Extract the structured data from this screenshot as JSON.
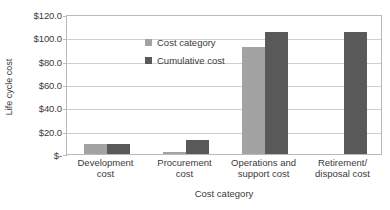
{
  "chart_data": {
    "type": "bar",
    "title": "",
    "xlabel": "Cost category",
    "ylabel": "Life cycle cost",
    "categories": [
      "Development cost",
      "Procurement cost",
      "Operations and support cost",
      "Retirement/ disposal cost"
    ],
    "category_lines": [
      [
        "Development",
        "cost"
      ],
      [
        "Procurement",
        "cost"
      ],
      [
        "Operations and",
        "support cost"
      ],
      [
        "Retirement/",
        "disposal cost"
      ]
    ],
    "series": [
      {
        "name": "Cost category",
        "color": "#a3a3a3",
        "values": [
          9,
          2,
          92,
          null
        ]
      },
      {
        "name": "Cumulative cost",
        "color": "#595959",
        "values": [
          9,
          12,
          105,
          105
        ]
      }
    ],
    "ylim": [
      0,
      120
    ],
    "ytick_values": [
      0,
      20,
      40,
      60,
      80,
      100,
      120
    ],
    "ytick_labels": [
      "$-",
      "$20.0",
      "$40.0",
      "$60.0",
      "$80.0",
      "$100.0",
      "$120.0"
    ],
    "grid": "horizontal",
    "legend_position": "top-left-inside",
    "legend": [
      "Cost category",
      "Cumulative cost"
    ]
  }
}
